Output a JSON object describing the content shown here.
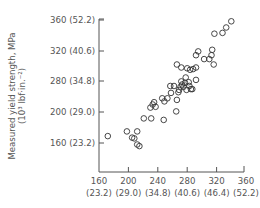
{
  "chart_data": {
    "type": "scatter",
    "title": "",
    "xlabel": "",
    "ylabel": "Measured yield strength, MPa",
    "ylabel_line2": "(10³ lbf·in.⁻²)",
    "x_ticks": [
      {
        "value": 160,
        "label": "160",
        "sublabel": "(23.2)"
      },
      {
        "value": 200,
        "label": "200",
        "sublabel": "(29.0)"
      },
      {
        "value": 240,
        "label": "240",
        "sublabel": "(34.8)"
      },
      {
        "value": 280,
        "label": "280",
        "sublabel": "(40.6)"
      },
      {
        "value": 320,
        "label": "320",
        "sublabel": "(46.4)"
      },
      {
        "value": 360,
        "label": "360",
        "sublabel": "(52.2)"
      }
    ],
    "y_ticks": [
      {
        "value": 160,
        "label": "160  (23.2)"
      },
      {
        "value": 200,
        "label": "200  (29.0)"
      },
      {
        "value": 240,
        "label": "280  (34.8)"
      },
      {
        "value": 280,
        "label": "320  (40.6)"
      },
      {
        "value": 320,
        "label": "360  (52.2)",
        "hidden_position": true
      }
    ],
    "y_tick_labels_displayed": [
      "360  (52.2)",
      "320  (40.6)",
      "280  (34.8)",
      "200  (29.0)",
      "160  (23.2)"
    ],
    "xlim": [
      160,
      360
    ],
    "ylim": [
      120,
      360
    ],
    "grid": false,
    "legend": null,
    "marker": "open-circle",
    "series": [
      {
        "name": "measured vs predicted yield strength",
        "points": [
          [
            172,
            169
          ],
          [
            198,
            175
          ],
          [
            212,
            175
          ],
          [
            205,
            167
          ],
          [
            208,
            166
          ],
          [
            212,
            158
          ],
          [
            215,
            156
          ],
          [
            221,
            192
          ],
          [
            231,
            192
          ],
          [
            248,
            190
          ],
          [
            230,
            206
          ],
          [
            233,
            210
          ],
          [
            235,
            213
          ],
          [
            237,
            207
          ],
          [
            246,
            218
          ],
          [
            249,
            214
          ],
          [
            253,
            218
          ],
          [
            257,
            234
          ],
          [
            258,
            225
          ],
          [
            262,
            234
          ],
          [
            265,
            201
          ],
          [
            266,
            216
          ],
          [
            268,
            226
          ],
          [
            269,
            229
          ],
          [
            271,
            233
          ],
          [
            272,
            240
          ],
          [
            273,
            236
          ],
          [
            275,
            233
          ],
          [
            277,
            238
          ],
          [
            278,
            245
          ],
          [
            279,
            229
          ],
          [
            282,
            239
          ],
          [
            283,
            234
          ],
          [
            285,
            230
          ],
          [
            287,
            230
          ],
          [
            292,
            242
          ],
          [
            266,
            262
          ],
          [
            272,
            258
          ],
          [
            280,
            257
          ],
          [
            284,
            255
          ],
          [
            288,
            256
          ],
          [
            292,
            258
          ],
          [
            292,
            274
          ],
          [
            295,
            279
          ],
          [
            303,
            269
          ],
          [
            310,
            269
          ],
          [
            313,
            274
          ],
          [
            314,
            281
          ],
          [
            316,
            262
          ],
          [
            317,
            302
          ],
          [
            328,
            303
          ],
          [
            333,
            310
          ],
          [
            340,
            318
          ]
        ]
      }
    ]
  },
  "axes": {
    "y_title_line1": "Measured yield strength, MPa",
    "y_title_line2": "(10³ lbf·in.⁻²)"
  }
}
